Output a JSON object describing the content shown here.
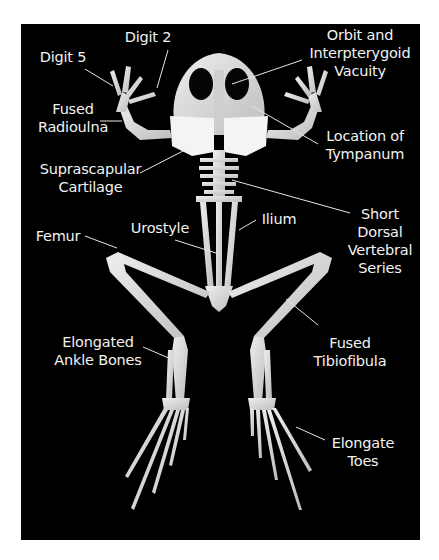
{
  "figure": {
    "background": "#000000",
    "bone_color": "#d9d9d9",
    "label_color": "#f2f2f2",
    "leader_color": "#e6e6e6"
  },
  "labels": [
    {
      "id": "digit-5",
      "text": "Digit 5",
      "x": 28,
      "y": 48,
      "w": 70,
      "line": [
        85,
        69,
        113,
        86
      ]
    },
    {
      "id": "digit-2",
      "text": "Digit 2",
      "x": 113,
      "y": 28,
      "w": 70,
      "line": [
        168,
        50,
        157,
        88
      ]
    },
    {
      "id": "orbit",
      "text": "Orbit and\nInterpterygoid\nVacuity",
      "x": 300,
      "y": 26,
      "w": 120,
      "line": [
        302,
        60,
        232,
        84
      ]
    },
    {
      "id": "fused-radioulna",
      "text": "Fused\nRadioulna",
      "x": 28,
      "y": 100,
      "w": 90,
      "line": [
        100,
        121,
        122,
        121
      ]
    },
    {
      "id": "tympanum",
      "text": "Location of\nTympanum",
      "x": 310,
      "y": 127,
      "w": 110,
      "line": [
        318,
        144,
        252,
        106
      ]
    },
    {
      "id": "suprascapular",
      "text": "Suprascapular\nCartilage",
      "x": 28,
      "y": 160,
      "w": 125,
      "line": [
        140,
        173,
        185,
        150
      ]
    },
    {
      "id": "short-dorsal",
      "text": "Short\nDorsal\nVertebral\nSeries",
      "x": 340,
      "y": 205,
      "w": 80,
      "line": [
        350,
        213,
        232,
        180
      ]
    },
    {
      "id": "ilium",
      "text": "Ilium",
      "x": 254,
      "y": 210,
      "w": 50,
      "line": [
        256,
        220,
        239,
        230
      ]
    },
    {
      "id": "femur",
      "text": "Femur",
      "x": 28,
      "y": 227,
      "w": 60,
      "line": [
        85,
        236,
        117,
        248
      ]
    },
    {
      "id": "urostyle",
      "text": "Urostyle",
      "x": 120,
      "y": 219,
      "w": 80,
      "line": [
        175,
        240,
        216,
        253
      ]
    },
    {
      "id": "elongated-ankle",
      "text": "Elongated\nAnkle Bones",
      "x": 48,
      "y": 333,
      "w": 100,
      "line": [
        143,
        347,
        171,
        359
      ]
    },
    {
      "id": "fused-tibiofibula",
      "text": "Fused\nTibiofibula",
      "x": 300,
      "y": 334,
      "w": 100,
      "line": [
        318,
        325,
        286,
        299
      ]
    },
    {
      "id": "elongate-toes",
      "text": "Elongate\nToes",
      "x": 318,
      "y": 434,
      "w": 90,
      "line": [
        325,
        440,
        296,
        427
      ]
    }
  ]
}
